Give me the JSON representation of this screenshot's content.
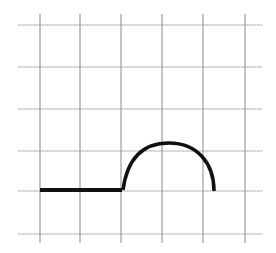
{
  "diagram": {
    "type": "graph-on-grid",
    "grid": {
      "color": "#8a8a8a",
      "vertical_lines_x": [
        40,
        80,
        121,
        162,
        203,
        245
      ],
      "vertical_y_range": [
        14,
        243
      ],
      "horizontal_lines_y": [
        25,
        67,
        109,
        151,
        191,
        234
      ],
      "horizontal_x_range": [
        18,
        263
      ]
    },
    "curve": {
      "color": "#111111",
      "segments": [
        {
          "kind": "line",
          "from": [
            40,
            190
          ],
          "to": [
            122,
            190
          ],
          "width": 4
        },
        {
          "kind": "arc",
          "from": [
            123,
            190
          ],
          "peak": [
            169,
            143
          ],
          "to": [
            214,
            191
          ],
          "width": 3.5
        }
      ]
    }
  }
}
